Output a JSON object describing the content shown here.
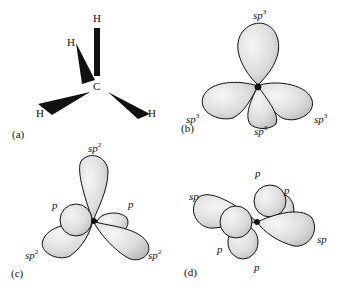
{
  "panels": {
    "a": {
      "label": "(a)",
      "atoms": {
        "top": "H",
        "upper_left": "H",
        "center": "C",
        "lower_left": "H",
        "lower_right": "H"
      }
    },
    "b": {
      "label": "(b)",
      "orbitals": {
        "top": "sp",
        "left": "sp",
        "bottom": "sp",
        "right": "sp"
      },
      "superscript": "3"
    },
    "c": {
      "label": "(c)",
      "orbitals": {
        "top": "sp",
        "p_left": "p",
        "p_right": "p",
        "lower_left": "sp",
        "lower_right": "sp"
      },
      "superscript": "2"
    },
    "d": {
      "label": "(d)",
      "orbitals": {
        "p_top": "p",
        "p_top_right": "p",
        "sp_left": "sp",
        "p_left": "p",
        "sp_right": "sp",
        "p_bottom": "p"
      }
    }
  },
  "colors": {
    "stroke": "#111111",
    "fill": "#e6e6e6",
    "shade": "#bdbdbd"
  }
}
